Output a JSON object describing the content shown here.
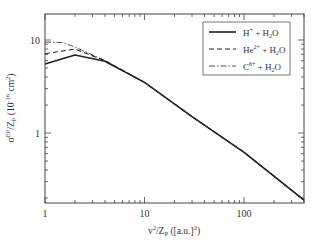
{
  "chart_data": {
    "type": "line",
    "title": "",
    "xlabel": "v²/Z_P ([a.u.]²)",
    "ylabel": "σ^EP/Z_P (10^-16 cm²)",
    "xscale": "log",
    "yscale": "log",
    "xlim": [
      1,
      400
    ],
    "ylim": [
      0.18,
      19
    ],
    "x_ticks": [
      {
        "value": 1,
        "label": "1"
      },
      {
        "value": 10,
        "label": "10"
      },
      {
        "value": 100,
        "label": "100"
      }
    ],
    "y_ticks": [
      {
        "value": 1,
        "label": "1"
      },
      {
        "value": 10,
        "label": "10"
      }
    ],
    "grid": false,
    "legend_position": "upper right",
    "series": [
      {
        "name": "H⁺ + H₂O",
        "label_base": "H",
        "label_sup": "+",
        "label_rest": " + H",
        "label_sub": "2",
        "label_end": "O",
        "style": "solid",
        "x": [
          1,
          2,
          4,
          10,
          30,
          100,
          400
        ],
        "y": [
          5.5,
          6.9,
          5.9,
          3.5,
          1.5,
          0.62,
          0.19
        ]
      },
      {
        "name": "He²⁺ + H₂O",
        "label_base": "He",
        "label_sup": "2+",
        "label_rest": " + H",
        "label_sub": "2",
        "label_end": "O",
        "style": "dashed",
        "x": [
          1,
          2,
          4,
          10,
          30,
          100,
          400
        ],
        "y": [
          7.1,
          8.0,
          6.0,
          3.5,
          1.5,
          0.62,
          0.19
        ]
      },
      {
        "name": "C⁶⁺ + H₂O",
        "label_base": "C",
        "label_sup": "6+",
        "label_rest": " + H",
        "label_sub": "2",
        "label_end": "O",
        "style": "dashdot",
        "x": [
          1,
          1.5,
          2,
          4,
          10,
          30,
          100,
          400
        ],
        "y": [
          9.5,
          9.4,
          8.4,
          6.0,
          3.5,
          1.5,
          0.62,
          0.19
        ]
      }
    ]
  }
}
